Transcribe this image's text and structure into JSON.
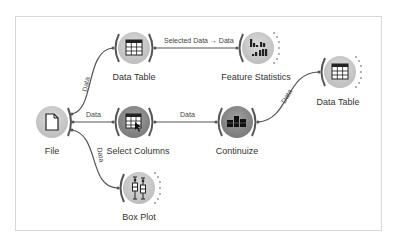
{
  "canvas": {
    "type": "orange-workflow",
    "colors": {
      "frame_border": "#d8d8d8",
      "link": "#555555",
      "node_light": "#c8c8c8",
      "node_dark": "#8a8a8a",
      "bracket": "#555555",
      "dots": "#9a9a9a"
    }
  },
  "nodes": [
    {
      "id": "file",
      "label": "File",
      "icon": "file-icon",
      "x": 52,
      "y": 122,
      "tone": "light"
    },
    {
      "id": "data-table-1",
      "label": "Data Table",
      "icon": "table-icon",
      "x": 134,
      "y": 48,
      "tone": "light"
    },
    {
      "id": "select-columns",
      "label": "Select Columns",
      "icon": "select-columns-icon",
      "x": 134,
      "y": 122,
      "tone": "dark"
    },
    {
      "id": "feature-statistics",
      "label": "Feature Statistics",
      "icon": "bar-chart-icon",
      "x": 258,
      "y": 48,
      "tone": "light"
    },
    {
      "id": "continuize",
      "label": "Continuize",
      "icon": "continuize-icon",
      "x": 237,
      "y": 122,
      "tone": "dark"
    },
    {
      "id": "data-table-2",
      "label": "Data Table",
      "icon": "table-icon",
      "x": 340,
      "y": 72,
      "tone": "light"
    },
    {
      "id": "box-plot",
      "label": "Box Plot",
      "icon": "box-plot-icon",
      "x": 139,
      "y": 188,
      "tone": "light"
    }
  ],
  "links": [
    {
      "from": "file",
      "to": "data-table-1",
      "label": "Data"
    },
    {
      "from": "file",
      "to": "select-columns",
      "label": "Data"
    },
    {
      "from": "file",
      "to": "box-plot",
      "label": "Data"
    },
    {
      "from": "data-table-1",
      "to": "feature-statistics",
      "label": "Selected Data → Data"
    },
    {
      "from": "select-columns",
      "to": "continuize",
      "label": "Data"
    },
    {
      "from": "continuize",
      "to": "data-table-2",
      "label": "Data"
    }
  ]
}
